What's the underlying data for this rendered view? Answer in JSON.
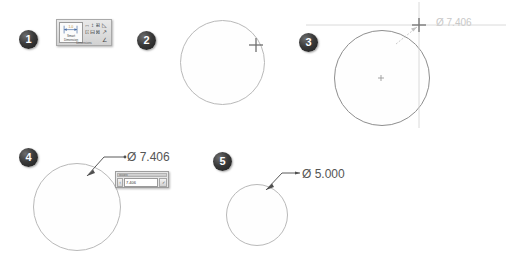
{
  "figure": {
    "background_color": "#ffffff",
    "steps": [
      {
        "number": "1",
        "caption": "Select Smart Dimension tool"
      },
      {
        "number": "2",
        "caption": "Hover over circle"
      },
      {
        "number": "3",
        "caption": "Click to place dimension"
      },
      {
        "number": "4",
        "caption": "Modify dialog appears"
      },
      {
        "number": "5",
        "caption": "Dimension updated"
      }
    ]
  },
  "colors": {
    "sketch_line": "#b9b9b9",
    "sketch_line_dark": "#8e8e8e",
    "dimension_ghost": "#c8c8c8",
    "dimension_solid": "#555555",
    "badge_fill": "#1b1b1b",
    "badge_text": "#ffffff",
    "toolbar_bg": "#d2d2d2",
    "dialog_bg": "#e6e6e6"
  },
  "step1": {
    "badge": "1",
    "toolbar": {
      "main_button_label": "Smart Dimension",
      "main_button_icon": "smart-dimension-icon",
      "caption": "Dimensions",
      "dropdown_arrow": "▾",
      "buttons": [
        {
          "icon": "horizontal-dimension-icon",
          "glyph": "↔"
        },
        {
          "icon": "vertical-dimension-icon",
          "glyph": "↕"
        },
        {
          "icon": "baseline-dimension-icon",
          "glyph": "⊞"
        },
        {
          "icon": "ordinate-dimension-icon",
          "glyph": "⊡"
        },
        {
          "icon": "horizontal-ordinate-icon",
          "glyph": "⊟"
        },
        {
          "icon": "vertical-ordinate-icon",
          "glyph": "⊠"
        },
        {
          "icon": "chamfer-dimension-icon",
          "glyph": "◺"
        },
        {
          "icon": "path-length-dimension-icon",
          "glyph": "↗"
        },
        {
          "icon": "angle-dimension-icon",
          "glyph": "∠"
        }
      ]
    }
  },
  "step2": {
    "badge": "2",
    "circle": {
      "diameter_px": 85,
      "name": "sketch-circle"
    },
    "cursor": {
      "icon": "crosshair-cursor-icon"
    }
  },
  "step3": {
    "badge": "3",
    "circle": {
      "diameter_px": 96,
      "name": "sketch-circle"
    },
    "center_mark": "center-point-icon",
    "cursor": {
      "icon": "crosshair-cursor-icon"
    },
    "dimension_preview": {
      "symbol": "Ø",
      "value": "7.406",
      "text": "Ø 7.406",
      "state": "preview"
    }
  },
  "step4": {
    "badge": "4",
    "circle": {
      "diameter_px": 88,
      "name": "sketch-circle"
    },
    "dimension": {
      "symbol": "Ø",
      "value": "7.406",
      "text": "Ø 7.406",
      "state": "placed"
    },
    "modify_dialog": {
      "title": "Modify",
      "input_value": "7.406",
      "spinner_icon": "spinner-icon",
      "accept_icon": "check-button-icon",
      "accept_label": "✓"
    },
    "leader": {
      "icon": "leader-arrow-icon"
    }
  },
  "step5": {
    "badge": "5",
    "circle": {
      "diameter_px": 62,
      "name": "sketch-circle"
    },
    "dimension": {
      "symbol": "Ø",
      "value": "5.000",
      "text": "Ø 5.000",
      "state": "applied"
    },
    "leader": {
      "icon": "leader-arrow-icon"
    }
  }
}
